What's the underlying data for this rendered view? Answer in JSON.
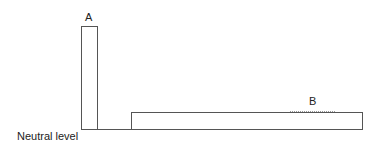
{
  "diagram": {
    "labels": {
      "column_a": "A",
      "column_b": "B",
      "baseline": "Neutral level"
    },
    "colors": {
      "stroke": "#555555",
      "background": "#ffffff",
      "text": "#222222"
    }
  }
}
